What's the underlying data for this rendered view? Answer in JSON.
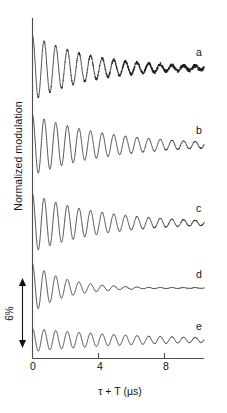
{
  "figure": {
    "axes": {
      "ylabel": "Normalized modulation",
      "xlabel": "τ + T (µs)",
      "xticks": [
        "0",
        "4",
        "8"
      ],
      "xtick_values": [
        0,
        4,
        8
      ],
      "xlim": [
        0,
        10.4
      ],
      "grid": false,
      "line_color": "#4d4d4d"
    },
    "scalebar": {
      "label": "6%",
      "value": 6,
      "units": "%",
      "arrow": "double-headed-vertical"
    },
    "trace_labels": [
      "a",
      "b",
      "c",
      "d",
      "e"
    ]
  },
  "chart_data": {
    "type": "line",
    "title": "",
    "subtitle": "",
    "xlabel": "τ + T (µs)",
    "ylabel": "Normalized modulation",
    "xlim": [
      0,
      10.4
    ],
    "xticks": [
      0,
      4,
      8
    ],
    "xticklabels": [
      "0",
      "4",
      "8"
    ],
    "ylim_note": "stacked traces, arbitrary offsets; vertical scale bar = 6% modulation",
    "grid": false,
    "legend": "inline trace labels at right end of each trace",
    "scalebar_percent": 6,
    "series": [
      {
        "name": "a",
        "label": "a",
        "baseline_y_px": 68,
        "amplitude_percent": 5.6,
        "frequency_mhz": 1.42,
        "decay_tau_us": 3.6,
        "noise_level": 0.16,
        "end_time_us": 10.4,
        "description": "largest initial modulation depth, strong damping, visible noise in tail"
      },
      {
        "name": "b",
        "label": "b",
        "baseline_y_px": 145,
        "amplitude_percent": 5.2,
        "frequency_mhz": 1.42,
        "decay_tau_us": 4.6,
        "noise_level": 0.03,
        "end_time_us": 10.4,
        "description": "deep modulation persisting to end of trace, smooth"
      },
      {
        "name": "c",
        "label": "c",
        "baseline_y_px": 223,
        "amplitude_percent": 5.0,
        "frequency_mhz": 1.42,
        "decay_tau_us": 4.2,
        "noise_level": 0.03,
        "end_time_us": 10.4,
        "description": "similar to b, slightly faster decay"
      },
      {
        "name": "d",
        "label": "d",
        "baseline_y_px": 288,
        "amplitude_percent": 4.2,
        "frequency_mhz": 1.42,
        "decay_tau_us": 2.0,
        "noise_level": 0.015,
        "end_time_us": 10.4,
        "description": "fastest decay, essentially flat after about 7 microseconds"
      },
      {
        "name": "e",
        "label": "e",
        "baseline_y_px": 340,
        "amplitude_percent": 2.0,
        "frequency_mhz": 1.42,
        "decay_tau_us": 6.5,
        "noise_level": 0.015,
        "end_time_us": 10.4,
        "description": "shallowest modulation depth, slow decay"
      }
    ]
  }
}
